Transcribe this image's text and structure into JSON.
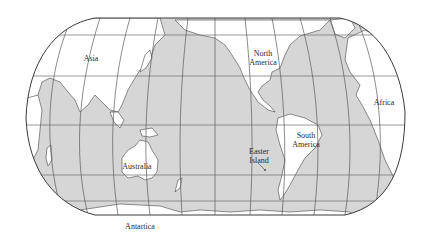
{
  "map": {
    "projection": "world map, Pacific-centered",
    "colors": {
      "ocean": "#d6d6d6",
      "land": "#ffffff",
      "outline": "#3a3a3a",
      "grid": "#6e6e6e",
      "text": "#2a2a2a"
    },
    "labels": [
      {
        "id": "asia",
        "lines": [
          "Asia"
        ],
        "x": 91,
        "y": 54
      },
      {
        "id": "north-america",
        "lines": [
          "North",
          "America"
        ],
        "x": 263,
        "y": 49
      },
      {
        "id": "africa",
        "lines": [
          "Africa"
        ],
        "x": 384,
        "y": 98
      },
      {
        "id": "south-america",
        "lines": [
          "South",
          "America"
        ],
        "x": 306,
        "y": 131
      },
      {
        "id": "easter-island",
        "lines": [
          "Easter",
          "Island"
        ],
        "x": 259,
        "y": 147
      },
      {
        "id": "australia",
        "lines": [
          "Australia"
        ],
        "x": 137,
        "y": 162
      },
      {
        "id": "antartica",
        "lines": [
          "Antartica"
        ],
        "x": 140,
        "y": 223
      }
    ]
  }
}
